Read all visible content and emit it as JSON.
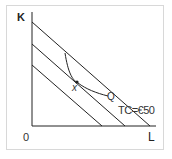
{
  "diagram": {
    "type": "isocost-isoquant",
    "axes": {
      "y_label": "K",
      "x_label": "L",
      "origin_label": "0"
    },
    "isocost_lines": [
      {
        "y_intercept_px": [
          32,
          22
        ],
        "x_intercept_px": [
          150,
          126
        ]
      },
      {
        "y_intercept_px": [
          32,
          44
        ],
        "x_intercept_px": [
          125,
          126
        ]
      },
      {
        "y_intercept_px": [
          32,
          65
        ],
        "x_intercept_px": [
          102,
          126
        ]
      }
    ],
    "isoquant": {
      "label": "Q"
    },
    "tangency_point": {
      "label": "x"
    },
    "budget_label": "TC=€50",
    "colors": {
      "line": "#222222",
      "border": "#d8d8d8"
    }
  }
}
